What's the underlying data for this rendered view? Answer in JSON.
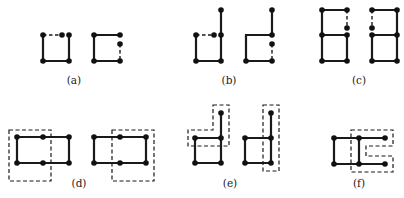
{
  "figure": {
    "panels": [
      {
        "id": "a",
        "label": "(a)"
      },
      {
        "id": "b",
        "label": "(b)"
      },
      {
        "id": "c",
        "label": "(c)"
      },
      {
        "id": "d",
        "label": "(d)"
      },
      {
        "id": "e",
        "label": "(e)"
      },
      {
        "id": "f",
        "label": "(f)"
      }
    ],
    "colors": {
      "ink": "#1a1a1a",
      "background": "#ffffff"
    }
  }
}
